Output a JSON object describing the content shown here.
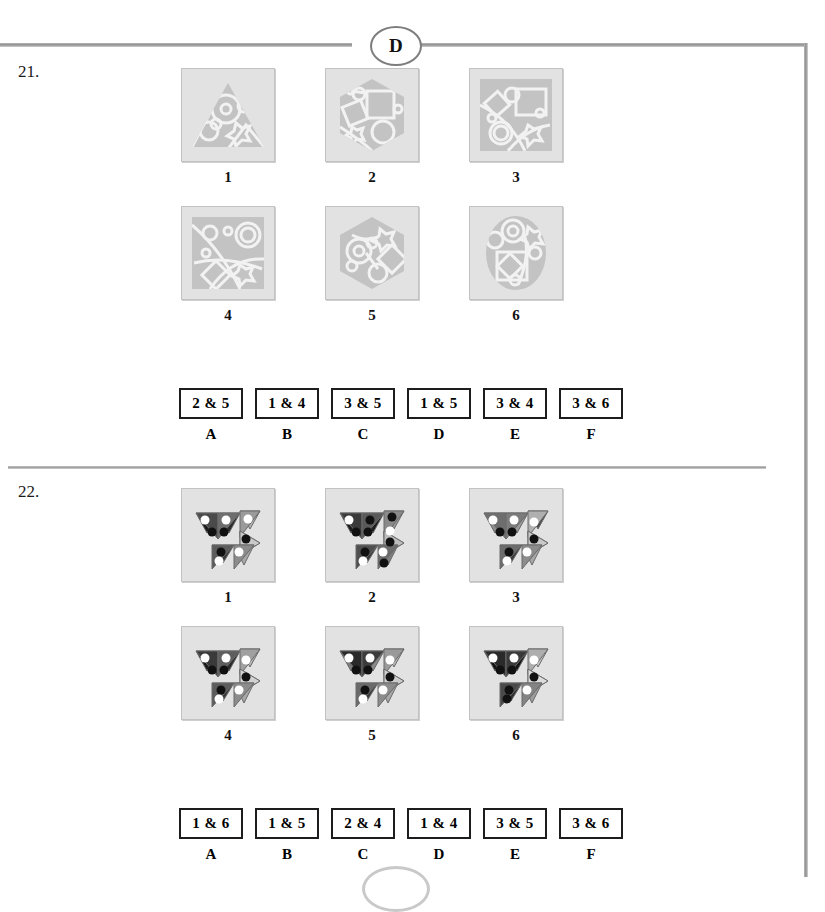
{
  "page": {
    "section_badge": "D",
    "background_color": "#ffffff",
    "rule_color": "#8f8f8f"
  },
  "questions": [
    {
      "number": "21.",
      "figures": [
        {
          "label": "1",
          "shape": "triangle"
        },
        {
          "label": "2",
          "shape": "hexagon"
        },
        {
          "label": "3",
          "shape": "square"
        },
        {
          "label": "4",
          "shape": "square"
        },
        {
          "label": "5",
          "shape": "hexagon"
        },
        {
          "label": "6",
          "shape": "ellipse"
        }
      ],
      "options": [
        {
          "letter": "A",
          "pair": "2 & 5"
        },
        {
          "letter": "B",
          "pair": "1 & 4"
        },
        {
          "letter": "C",
          "pair": "3 & 5"
        },
        {
          "letter": "D",
          "pair": "1 & 5"
        },
        {
          "letter": "E",
          "pair": "3 & 4"
        },
        {
          "letter": "F",
          "pair": "3 & 6"
        }
      ]
    },
    {
      "number": "22.",
      "figures": [
        {
          "label": "1",
          "shape": "arrow-cluster"
        },
        {
          "label": "2",
          "shape": "arrow-cluster"
        },
        {
          "label": "3",
          "shape": "arrow-cluster"
        },
        {
          "label": "4",
          "shape": "arrow-cluster"
        },
        {
          "label": "5",
          "shape": "arrow-cluster"
        },
        {
          "label": "6",
          "shape": "arrow-cluster"
        }
      ],
      "options": [
        {
          "letter": "A",
          "pair": "1 & 6"
        },
        {
          "letter": "B",
          "pair": "1 & 5"
        },
        {
          "letter": "C",
          "pair": "2 & 4"
        },
        {
          "letter": "D",
          "pair": "1 & 4"
        },
        {
          "letter": "E",
          "pair": "3 & 5"
        },
        {
          "letter": "F",
          "pair": "3 & 6"
        }
      ]
    }
  ]
}
